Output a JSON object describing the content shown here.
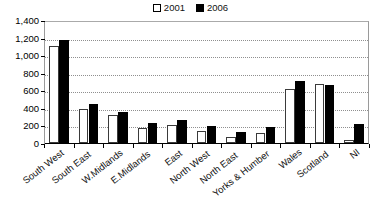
{
  "chart_data": {
    "type": "bar",
    "title": "",
    "subtitle": "",
    "xlabel": "",
    "ylabel": "",
    "ylim": [
      0,
      1400
    ],
    "ytick_step": 200,
    "grid": true,
    "legend_position": "top-center",
    "categories": [
      "South West",
      "South East",
      "W.Midlands",
      "E.Midlands",
      "East",
      "North West",
      "North East",
      "Yorks & Humber",
      "Wales",
      "Scotland",
      "NI"
    ],
    "ytick_labels": [
      "0",
      "200",
      "400",
      "600",
      "800",
      "1,000",
      "1,200",
      "1,400"
    ],
    "ytick_values": [
      0,
      200,
      400,
      600,
      800,
      1000,
      1200,
      1400
    ],
    "series": [
      {
        "name": "2001",
        "color": "#ffffff",
        "edge_color": "#3a3a3a",
        "values": [
          1100,
          390,
          320,
          170,
          200,
          140,
          70,
          115,
          620,
          675,
          40
        ]
      },
      {
        "name": "2006",
        "color": "#000000",
        "edge_color": "#000000",
        "values": [
          1170,
          440,
          350,
          225,
          260,
          190,
          125,
          180,
          710,
          660,
          215
        ]
      }
    ]
  },
  "legend": {
    "items": [
      {
        "label": "2001",
        "swatch": "open-square-icon"
      },
      {
        "label": "2006",
        "swatch": "filled-square-icon"
      }
    ]
  }
}
